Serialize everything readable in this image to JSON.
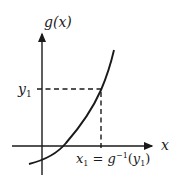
{
  "diagram": {
    "y_axis_label": "g(x)",
    "x_axis_label": "x",
    "y_tick_label": {
      "base": "y",
      "sub": "1"
    },
    "x_tick_label": {
      "x": "x",
      "xsub": "1",
      "eq": " = ",
      "g": "g",
      "sup": "−1",
      "open": "(",
      "y": "y",
      "ysub": "1",
      "close": ")"
    },
    "colors": {
      "ink": "#1a1a1a",
      "background": "#ffffff"
    }
  }
}
